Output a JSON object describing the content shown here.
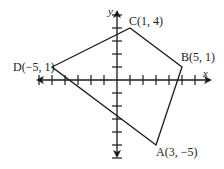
{
  "diagram": {
    "type": "coordinate-plane-quadrilateral",
    "axes": {
      "x_label": "x",
      "y_label": "y"
    },
    "vertices": [
      {
        "name": "A",
        "x": 3,
        "y": -5,
        "label": "A(3, −5)"
      },
      {
        "name": "B",
        "x": 5,
        "y": 1,
        "label": "B(5, 1)"
      },
      {
        "name": "C",
        "x": 1,
        "y": 4,
        "label": "C(1, 4)"
      },
      {
        "name": "D",
        "x": -5,
        "y": 1,
        "label": "D(−5, 1)"
      }
    ],
    "polygon_order": [
      "A",
      "B",
      "C",
      "D"
    ],
    "x_ticks": [
      -6,
      -5,
      -4,
      -3,
      -2,
      -1,
      1,
      2,
      3,
      4,
      5,
      6
    ],
    "y_ticks": [
      -6,
      -5,
      -4,
      -3,
      -2,
      -1,
      1,
      2,
      3,
      4,
      5
    ],
    "line_color": "#1a1a1a"
  }
}
